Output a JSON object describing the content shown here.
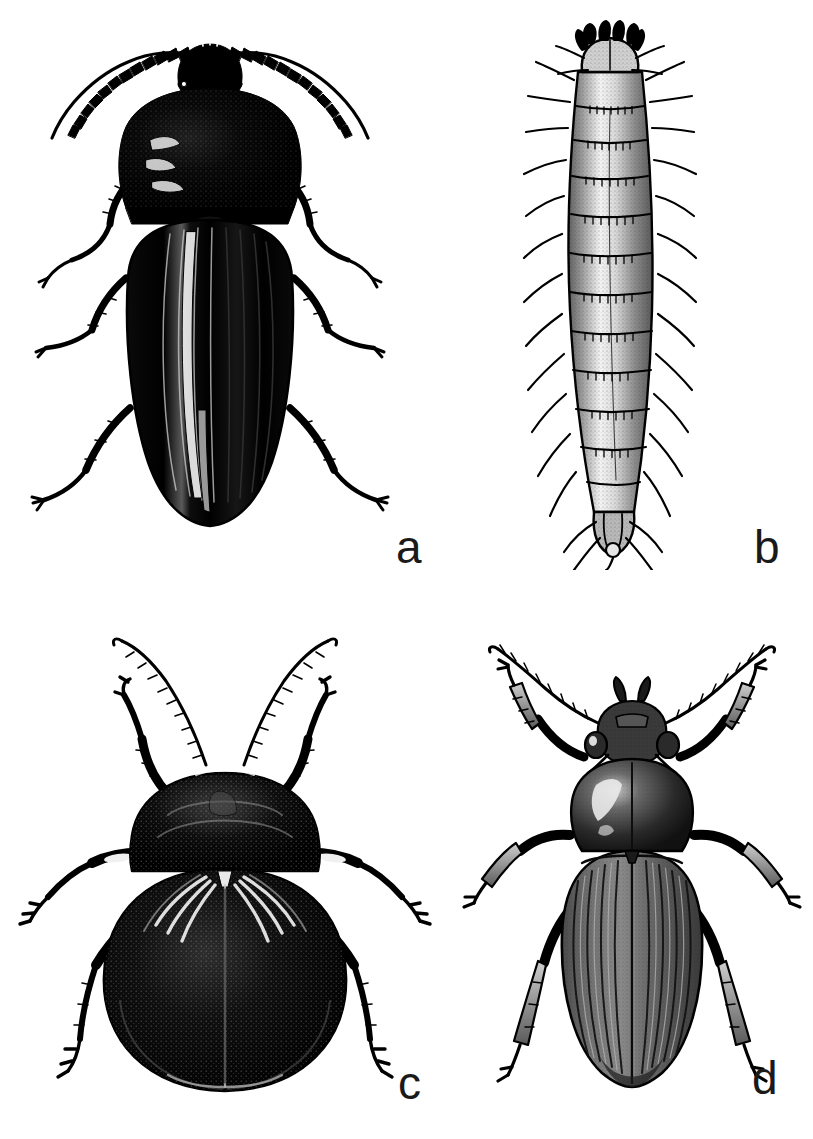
{
  "figure": {
    "type": "scientific-illustration-plate",
    "background_color": "#ffffff",
    "ink_color": "#000000",
    "label_color": "#1a1a1a",
    "width": 813,
    "height": 1139,
    "panel_count": 4,
    "style": "black-and-white stipple / line engraving"
  },
  "panels": [
    {
      "label": "a",
      "subject": "adult-click-beetle-dorsal",
      "description": "Elongate dark adult beetle in dorsal view with serrate antennae, large pronotum and longitudinally striate elytra",
      "tone": "solid black",
      "orientation": "head up",
      "label_position": "bottom-right"
    },
    {
      "label": "b",
      "subject": "beetle-larva-wireworm-dorsal",
      "description": "Elongate cylindrical segmented larva with setae on each segment, dark head capsule with mandibles and a terminal segment",
      "tone": "light stipple with dark outlines",
      "orientation": "head up",
      "label_position": "bottom-right"
    },
    {
      "label": "c",
      "subject": "broad-oval-beetle-dorsal",
      "description": "Broad rounded beetle in dorsal view with very long filiform antennae, rounded pronotum and convex oval elytra",
      "tone": "dense black stipple",
      "orientation": "head up",
      "label_position": "bottom-right"
    },
    {
      "label": "d",
      "subject": "ground-beetle-carabid-dorsal",
      "description": "Ground beetle in dorsal view with long slender antennae, glossy heart-shaped pronotum and strongly striate elytra with long legs",
      "tone": "grey halftone stipple",
      "orientation": "head up",
      "label_position": "bottom-right"
    }
  ],
  "labels": {
    "a": "a",
    "b": "b",
    "c": "c",
    "d": "d"
  }
}
